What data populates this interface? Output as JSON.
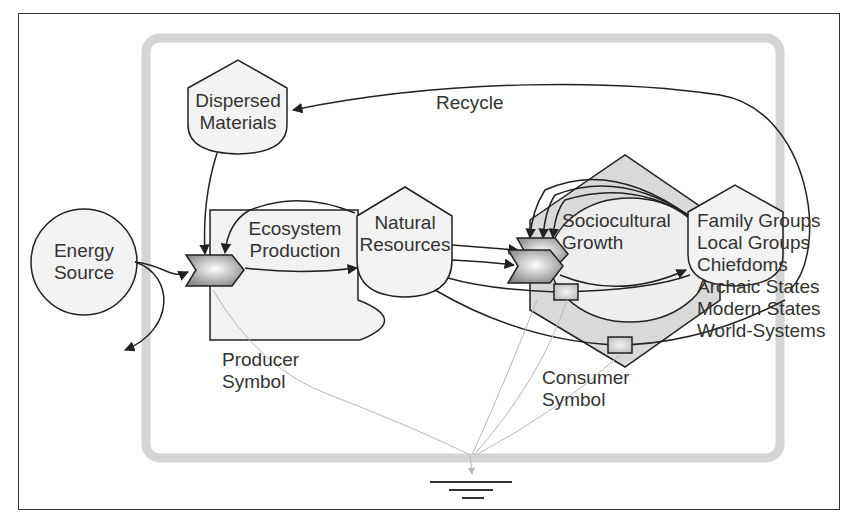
{
  "diagram": {
    "colors": {
      "stroke": "#222222",
      "fill_light": "#efefef",
      "fill_mid": "#d9d9d9",
      "boundary": "#d4d4d4",
      "heat_sink_lines": "#b8b8b8"
    },
    "nodes": {
      "energy_source": {
        "line1": "Energy",
        "line2": "Source"
      },
      "dispersed_materials": {
        "line1": "Dispersed",
        "line2": "Materials"
      },
      "ecosystem_production": {
        "line1": "Ecosystem",
        "line2": "Production"
      },
      "natural_resources": {
        "line1": "Natural",
        "line2": "Resources"
      },
      "sociocultural_growth": {
        "line1": "Sociocultural",
        "line2": "Growth"
      },
      "societies": {
        "items": [
          "Family Groups",
          "Local Groups",
          "Chiefdoms",
          "Archaic States",
          "Modern States",
          "World-Systems"
        ]
      }
    },
    "labels": {
      "recycle": "Recycle",
      "producer_symbol": {
        "line1": "Producer",
        "line2": "Symbol"
      },
      "consumer_symbol": {
        "line1": "Consumer",
        "line2": "Symbol"
      }
    },
    "icons": [
      "heat-sink-icon",
      "interaction-gate-icon",
      "storage-tank-icon",
      "energy-source-circle-icon"
    ]
  }
}
